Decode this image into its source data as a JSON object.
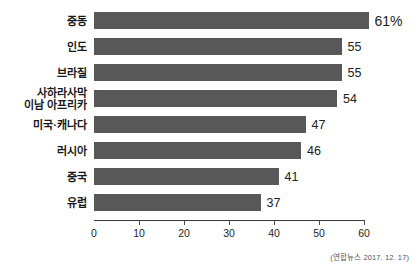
{
  "chart_data": {
    "type": "bar",
    "orientation": "horizontal",
    "title": "",
    "subtitle": "",
    "xlabel": "",
    "ylabel": "",
    "xlim": [
      0,
      60
    ],
    "ylim": null,
    "grid": false,
    "legend": null,
    "bar_color": "#585858",
    "axis_color": "#3a3a3a",
    "categories": [
      "중동",
      "인도",
      "브라질",
      "사하라사막 이남 아프리카",
      "미국·캐나다",
      "러시아",
      "중국",
      "유럽"
    ],
    "values": [
      61,
      55,
      55,
      54,
      47,
      46,
      41,
      37
    ],
    "value_labels": [
      "61%",
      "55",
      "55",
      "54",
      "47",
      "46",
      "41",
      "37"
    ],
    "xticks": [
      0,
      10,
      20,
      30,
      40,
      50,
      60
    ],
    "xticklabels": [
      "0",
      "10",
      "20",
      "30",
      "40",
      "50",
      "60"
    ],
    "bars": [
      {
        "label_lines": [
          "중동"
        ],
        "value": 61,
        "value_label": "61%"
      },
      {
        "label_lines": [
          "인도"
        ],
        "value": 55,
        "value_label": "55"
      },
      {
        "label_lines": [
          "브라질"
        ],
        "value": 55,
        "value_label": "55"
      },
      {
        "label_lines": [
          "사하라사막",
          "이남 아프리카"
        ],
        "value": 54,
        "value_label": "54"
      },
      {
        "label_lines": [
          "미국·캐나다"
        ],
        "value": 47,
        "value_label": "47"
      },
      {
        "label_lines": [
          "러시아"
        ],
        "value": 46,
        "value_label": "46"
      },
      {
        "label_lines": [
          "중국"
        ],
        "value": 41,
        "value_label": "41"
      },
      {
        "label_lines": [
          "유럽"
        ],
        "value": 37,
        "value_label": "37"
      }
    ],
    "annotations": [
      {
        "name": "source",
        "text": "(연합뉴스 2017. 12. 17)"
      }
    ]
  },
  "source": {
    "text": "(연합뉴스 2017. 12. 17)"
  }
}
